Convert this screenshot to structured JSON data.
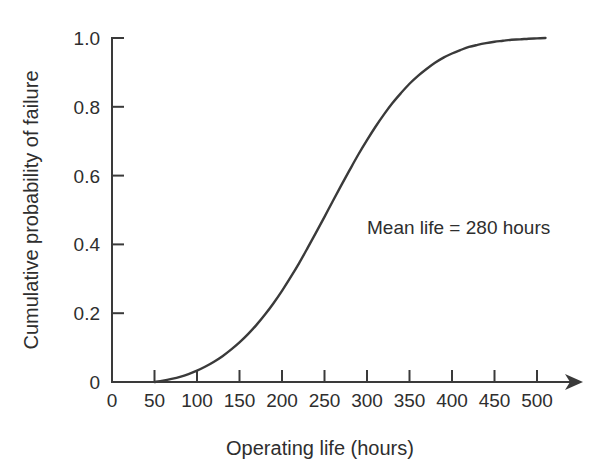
{
  "chart_data": {
    "type": "line",
    "title": "",
    "xlabel": "Operating life (hours)",
    "ylabel": "Cumulative probability of failure",
    "xlim": [
      0,
      520
    ],
    "ylim": [
      0,
      1.0
    ],
    "grid": false,
    "legend": null,
    "x_tick_labels": [
      "0",
      "50",
      "100",
      "150",
      "200",
      "250",
      "300",
      "350",
      "400",
      "450",
      "500"
    ],
    "x_tick_values": [
      0,
      50,
      100,
      150,
      200,
      250,
      300,
      350,
      400,
      450,
      500
    ],
    "y_tick_labels": [
      "0",
      "0.2",
      "0.4",
      "0.6",
      "0.8",
      "1.0"
    ],
    "y_tick_values": [
      0,
      0.2,
      0.4,
      0.6,
      0.8,
      1.0
    ],
    "annotations": [
      {
        "text": "Mean life = 280 hours",
        "x": 300,
        "y": 0.43
      }
    ],
    "series": [
      {
        "name": "Cumulative probability of failure",
        "color": "#3a3a3a",
        "x": [
          50,
          60,
          70,
          80,
          90,
          100,
          110,
          120,
          130,
          140,
          150,
          160,
          170,
          180,
          190,
          200,
          210,
          220,
          230,
          240,
          250,
          260,
          270,
          280,
          290,
          300,
          310,
          320,
          330,
          340,
          350,
          360,
          370,
          380,
          390,
          400,
          410,
          420,
          430,
          440,
          450,
          460,
          470,
          480,
          490,
          500,
          510
        ],
        "y": [
          0.0,
          0.004,
          0.009,
          0.015,
          0.023,
          0.033,
          0.045,
          0.059,
          0.075,
          0.094,
          0.115,
          0.139,
          0.166,
          0.196,
          0.229,
          0.265,
          0.304,
          0.345,
          0.389,
          0.434,
          0.48,
          0.527,
          0.573,
          0.618,
          0.662,
          0.703,
          0.742,
          0.778,
          0.811,
          0.84,
          0.867,
          0.89,
          0.91,
          0.928,
          0.943,
          0.955,
          0.965,
          0.974,
          0.98,
          0.985,
          0.989,
          0.992,
          0.995,
          0.996,
          0.998,
          0.999,
          1.0
        ]
      }
    ]
  },
  "axes": {
    "x_axis_has_arrow": true,
    "arrow_icon_name": "axis-arrow-icon"
  },
  "colors": {
    "curve": "#3a3a3a",
    "axis": "#3a3a3a",
    "text": "#2e2e2e",
    "background": "#ffffff"
  }
}
